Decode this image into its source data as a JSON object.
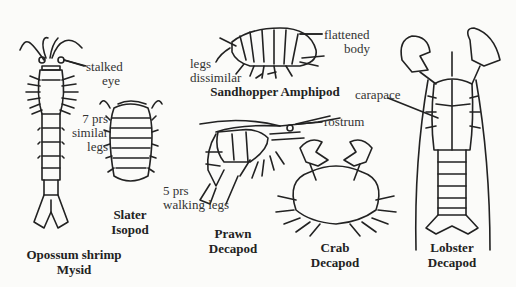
{
  "diagram": {
    "organisms": [
      {
        "id": "opossum-shrimp",
        "common": "Opossum shrimp",
        "group": "Mysid",
        "annotations": [
          "stalked eye",
          "7 prs similar legs"
        ]
      },
      {
        "id": "slater",
        "common": "Slater",
        "group": "Isopod",
        "annotations": []
      },
      {
        "id": "sandhopper",
        "common": "Sandhopper Amphipod",
        "group": "",
        "annotations": [
          "flattened body",
          "legs dissimilar"
        ]
      },
      {
        "id": "prawn",
        "common": "Prawn",
        "group": "Decapod",
        "annotations": [
          "rostrum",
          "5 prs walking legs"
        ]
      },
      {
        "id": "crab",
        "common": "Crab",
        "group": "Decapod",
        "annotations": []
      },
      {
        "id": "lobster",
        "common": "Lobster",
        "group": "Decapod",
        "annotations": [
          "carapace"
        ]
      }
    ],
    "labels": {
      "stalked": "stalked",
      "eye": "eye",
      "seven_prs": "7 prs",
      "similar": "similar",
      "legs": "legs",
      "flattened": "flattened",
      "body": "body",
      "legs2": "legs",
      "dissimilar": "dissimilar",
      "rostrum": "rostrum",
      "carapace": "carapace",
      "five_prs": "5 prs",
      "walking_legs": "walking legs"
    },
    "names": {
      "mysid_1": "Opossum shrimp",
      "mysid_2": "Mysid",
      "slater_1": "Slater",
      "slater_2": "Isopod",
      "sandhopper": "Sandhopper Amphipod",
      "prawn_1": "Prawn",
      "prawn_2": "Decapod",
      "crab_1": "Crab",
      "crab_2": "Decapod",
      "lobster_1": "Lobster",
      "lobster_2": "Decapod"
    }
  }
}
